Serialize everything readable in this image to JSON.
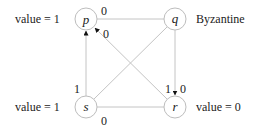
{
  "diagram": {
    "nodes": [
      {
        "id": "p",
        "label": "p",
        "annotation": "value = 1",
        "cx": 86,
        "cy": 19
      },
      {
        "id": "q",
        "label": "q",
        "annotation": "Byzantine",
        "cx": 175,
        "cy": 19
      },
      {
        "id": "s",
        "label": "s",
        "annotation": "value = 1",
        "cx": 86,
        "cy": 107
      },
      {
        "id": "r",
        "label": "r",
        "annotation": "value = 0",
        "cx": 175,
        "cy": 107
      }
    ],
    "edges": [
      {
        "from": "p",
        "to": "q",
        "directed": false,
        "labels": [
          "0"
        ]
      },
      {
        "from": "q",
        "to": "r",
        "directed": true,
        "labels": [
          "1",
          "0"
        ]
      },
      {
        "from": "s",
        "to": "p",
        "directed": true,
        "labels": [
          "1"
        ]
      },
      {
        "from": "s",
        "to": "r",
        "directed": false,
        "labels": [
          "0"
        ]
      },
      {
        "from": "q",
        "to": "s",
        "directed": false,
        "labels": []
      },
      {
        "from": "r",
        "to": "p",
        "directed": true,
        "labels": [
          "0"
        ]
      }
    ],
    "edge_labels": {
      "pq_top": "0",
      "rp_diag": "0",
      "sp_left": "1",
      "qr_left": "1",
      "qr_right": "0",
      "sr_bottom": "0"
    },
    "colors": {
      "node_stroke": "#bdbdbd",
      "edge": "#c4c4c4",
      "arrow": "#111111",
      "text": "#222222"
    }
  }
}
